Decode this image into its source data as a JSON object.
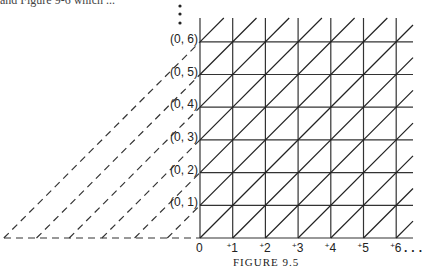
{
  "header_fragment": "and Figure 9-6 which ...",
  "diagram": {
    "type": "lattice-grid",
    "origin_label": "0",
    "x_labels": [
      "+1",
      "+2",
      "+3",
      "+4",
      "+5",
      "+6"
    ],
    "x_continuation": "...",
    "y_labels": [
      "(0, 1)",
      "(0, 2)",
      "(0, 3)",
      "(0, 4)",
      "(0, 5)",
      "(0, 6)"
    ],
    "y_continuation": "⋮",
    "caption": "FIGURE 9.5",
    "line_color": "#333333"
  }
}
